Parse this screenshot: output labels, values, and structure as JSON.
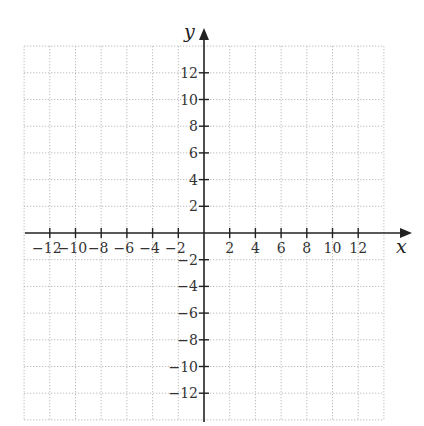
{
  "chart_data": {
    "type": "scatter",
    "title": "",
    "xlabel": "x",
    "ylabel": "y",
    "xlim": [
      -14,
      14
    ],
    "ylim": [
      -14,
      14
    ],
    "grid": true,
    "grid_style": "dotted",
    "grid_step": 2,
    "x_ticks": [
      -12,
      -10,
      -8,
      -6,
      -4,
      -2,
      2,
      4,
      6,
      8,
      10,
      12
    ],
    "x_tick_labels": [
      "−12",
      "−10",
      "−8",
      "−6",
      "−4",
      "−2",
      "2",
      "4",
      "6",
      "8",
      "10",
      "12"
    ],
    "y_ticks": [
      12,
      10,
      8,
      6,
      4,
      2,
      -2,
      -4,
      -6,
      -8,
      -10,
      -12
    ],
    "y_tick_labels": [
      "12",
      "10",
      "8",
      "6",
      "4",
      "2",
      "−2",
      "−4",
      "−6",
      "−8",
      "−10",
      "−12"
    ],
    "series": [],
    "legend": null
  },
  "colors": {
    "axis": "#222222",
    "grid": "#b8b8b8",
    "text": "#333333"
  }
}
